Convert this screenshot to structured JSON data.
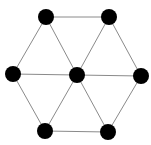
{
  "diagram": {
    "type": "graph",
    "edge_color": "#8a8a8a",
    "node_color": "#000000",
    "node_radius": 8,
    "nodes": [
      {
        "id": "top-left",
        "x": 46,
        "y": 17
      },
      {
        "id": "top-right",
        "x": 109,
        "y": 17
      },
      {
        "id": "left",
        "x": 13,
        "y": 74
      },
      {
        "id": "center",
        "x": 77,
        "y": 75
      },
      {
        "id": "right",
        "x": 141,
        "y": 76
      },
      {
        "id": "bottom-left",
        "x": 45,
        "y": 131
      },
      {
        "id": "bottom-right",
        "x": 108,
        "y": 132
      }
    ],
    "edges": [
      [
        "top-left",
        "top-right"
      ],
      [
        "top-left",
        "left"
      ],
      [
        "top-left",
        "center"
      ],
      [
        "top-right",
        "center"
      ],
      [
        "top-right",
        "right"
      ],
      [
        "left",
        "center"
      ],
      [
        "center",
        "right"
      ],
      [
        "left",
        "bottom-left"
      ],
      [
        "center",
        "bottom-left"
      ],
      [
        "center",
        "bottom-right"
      ],
      [
        "right",
        "bottom-right"
      ],
      [
        "bottom-left",
        "bottom-right"
      ]
    ]
  }
}
